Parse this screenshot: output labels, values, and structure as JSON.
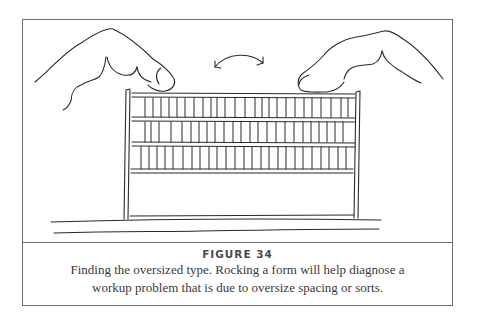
{
  "figure": {
    "label": "FIGURE 34",
    "caption_line1": "Finding the oversized type.  Rocking a form will help diagnose a",
    "caption_line2": "workup problem that is due to oversize spacing or sorts.",
    "illustration": {
      "description": "Two hands pressing down on the top corners of a form of type in a chase, rocking it back and forth",
      "icons": [
        "left-hand",
        "right-hand",
        "rocking-arrow",
        "type-form",
        "base-surface"
      ]
    }
  },
  "colors": {
    "line": "#2a2a2a",
    "border": "#6b6b6b",
    "text": "#3a3a3a"
  }
}
